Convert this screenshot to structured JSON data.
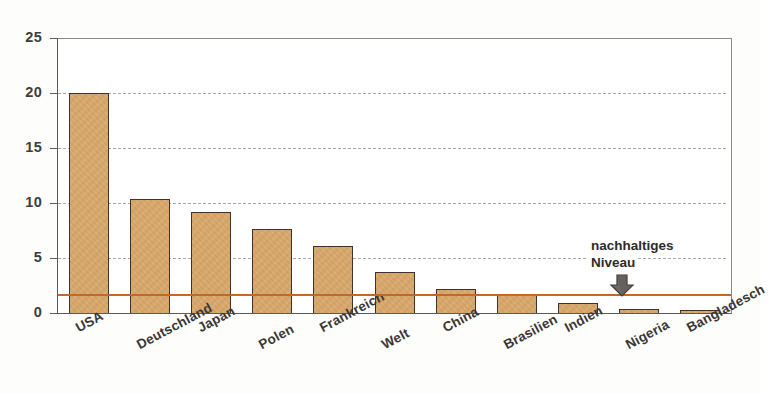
{
  "chart_data": {
    "type": "bar",
    "title": "",
    "xlabel": "",
    "ylabel": "",
    "ylim": [
      0,
      25
    ],
    "yticks": [
      0,
      5,
      10,
      15,
      20,
      25
    ],
    "grid": true,
    "grid_values": [
      5,
      10,
      15,
      20
    ],
    "legend": "none",
    "categories": [
      "USA",
      "Deutschland",
      "Japan",
      "Polen",
      "Frankreich",
      "Welt",
      "China",
      "Brasilien",
      "Indien",
      "Nigeria",
      "Bangladesch"
    ],
    "values": [
      20.0,
      10.4,
      9.2,
      7.6,
      6.1,
      3.7,
      2.2,
      1.6,
      0.9,
      0.4,
      0.2
    ],
    "reference_line": {
      "value": 1.7,
      "label": "nachhaltiges Niveau",
      "label_line1": "nachhaltiges",
      "label_line2": "Niveau",
      "color": "#c0692a",
      "annotation_icon": "down-arrow-icon"
    },
    "colors": {
      "bar_fill": "#dcae74",
      "bar_border": "#3b332c",
      "reference_line": "#c0692a",
      "gridline": "#9a9aa4",
      "axis": "#5d5b57",
      "text": "#3a3733"
    }
  }
}
